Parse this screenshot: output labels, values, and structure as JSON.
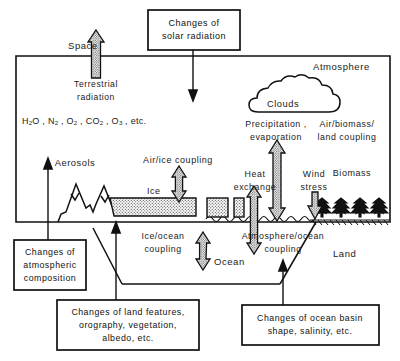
{
  "figure": {
    "regions": {
      "space": "Space",
      "atmosphere": "Atmosphere",
      "land": "Land",
      "ocean": "Ocean",
      "ice": "Ice"
    },
    "labels": {
      "terrestrial_radiation": "Terrestrial\nradiation",
      "atmospheric_composition": "H₂O, N₂, O₂, CO₂, O₃, etc.",
      "aerosols": "Aerosols",
      "clouds": "Clouds",
      "air_ice_coupling": "Air/ice coupling",
      "ice_ocean_coupling": "Ice/ocean\ncoupling",
      "heat_exchange": "Heat\nexchange",
      "precipitation_evaporation": "Precipitation ,\nevaporation",
      "atmosphere_ocean_coupling": "Atmosphere/ocean\ncoupling",
      "wind_stress": "Wind\nstress",
      "biomass": "Biomass",
      "air_biomass_land_coupling": "Air/biomass/\nland coupling"
    },
    "change_boxes": [
      {
        "id": "solar-radiation",
        "lines": [
          "Changes of",
          "solar radiation"
        ]
      },
      {
        "id": "atmospheric-composition",
        "lines": [
          "Changes of",
          "atmospheric",
          "composition"
        ]
      },
      {
        "id": "land-features",
        "lines": [
          "Changes of land features,",
          "orography, vegetation,",
          "albedo, etc."
        ]
      },
      {
        "id": "ocean-basin",
        "lines": [
          "Changes of ocean basin",
          "shape, salinity, etc."
        ]
      }
    ],
    "colors": {
      "line": "#111111",
      "text": "#1a1a1a",
      "background": "#ffffff",
      "ice_fill": "#cfcfcf",
      "arrow_fill": "#d9d9d9"
    }
  }
}
